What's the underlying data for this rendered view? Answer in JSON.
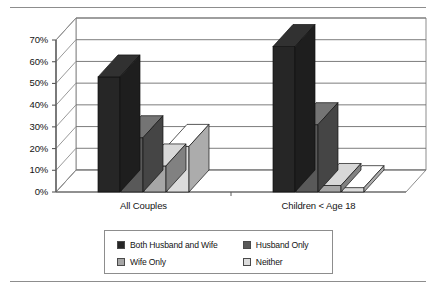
{
  "chart_data": {
    "type": "bar",
    "title": "",
    "subtitle": "",
    "xlabel": "",
    "ylabel": "",
    "categories": [
      "All Couples",
      "Children < Age 18"
    ],
    "series": [
      {
        "name": "Both Husband and Wife",
        "values": [
          53,
          67
        ],
        "color": "#262626"
      },
      {
        "name": "Husband Only",
        "values": [
          25,
          31
        ],
        "color": "#595959"
      },
      {
        "name": "Wife Only",
        "values": [
          12,
          3
        ],
        "color": "#a6a6a6"
      },
      {
        "name": "Neither",
        "values": [
          21,
          2
        ],
        "color": "#dcdcdc"
      }
    ],
    "ylim": [
      0,
      70
    ],
    "ytick_step": 10,
    "ytick_labels": [
      "0%",
      "10%",
      "20%",
      "30%",
      "40%",
      "50%",
      "60%",
      "70%"
    ],
    "ytick_values": [
      0,
      10,
      20,
      30,
      40,
      50,
      60,
      70
    ],
    "grid": true,
    "grid_axis": "y",
    "legend": true,
    "legend_position": "bottom",
    "three_d": true
  },
  "legend": {
    "rows": [
      [
        {
          "label": "Both Husband and Wife",
          "color": "#262626"
        },
        {
          "label": "Husband Only",
          "color": "#595959"
        }
      ],
      [
        {
          "label": "Wife Only",
          "color": "#a6a6a6"
        },
        {
          "label": "Neither",
          "color": "#dcdcdc"
        }
      ]
    ]
  }
}
